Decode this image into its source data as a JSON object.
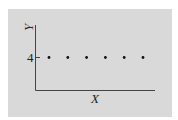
{
  "chart_data": {
    "type": "scatter",
    "title": "",
    "xlabel": "X",
    "ylabel": "Y",
    "x": [
      1,
      2,
      3,
      4,
      5,
      6
    ],
    "values": [
      4,
      4,
      4,
      4,
      4,
      4
    ],
    "series": [
      {
        "name": "points",
        "x": [
          1,
          2,
          3,
          4,
          5,
          6
        ],
        "y": [
          4,
          4,
          4,
          4,
          4,
          4
        ]
      }
    ],
    "yticks": [
      "4"
    ],
    "xticks": [],
    "grid": false,
    "legend": null,
    "colors": {
      "background": "#d9d9d9",
      "axis": "#444444",
      "point": "#111111"
    }
  }
}
